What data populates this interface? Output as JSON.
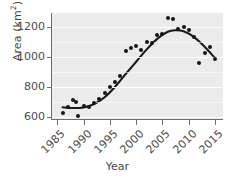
{
  "chart_data": {
    "type": "scatter",
    "title": "",
    "xlabel": "Year",
    "ylabel_text": "Area (km",
    "ylabel_sup": "2",
    "ylabel_tail": ")",
    "ylabel_full": "Area (km2)",
    "xlim": [
      1984,
      2016.5
    ],
    "ylim": [
      585,
      1290
    ],
    "xticks": [
      1985,
      1990,
      1995,
      2000,
      2005,
      2010,
      2015
    ],
    "xtick_labels": [
      "1985",
      "1990",
      "1995",
      "2000",
      "2005",
      "2010",
      "2015"
    ],
    "yticks": [
      600,
      800,
      1000,
      1200
    ],
    "ytick_labels": [
      "600",
      "800",
      "1000",
      "1200"
    ],
    "grid": "horizontal-white-on-gray-panel",
    "legend": "none",
    "panel_color": "#ebebeb",
    "point_color": "#161616",
    "line_color": "#1a1a1a",
    "series": [
      {
        "name": "Observed area",
        "marker": "filled-circle",
        "x": [
          1986,
          1987,
          1988,
          1988.6,
          1989,
          1990,
          1991,
          1992,
          1993,
          1994,
          1995,
          1996,
          1997,
          1998,
          1999,
          2000,
          2001,
          2002,
          2003,
          2004,
          2005,
          2006,
          2007,
          2008,
          2009,
          2010,
          2011,
          2012,
          2013,
          2014,
          2015
        ],
        "y": [
          625,
          665,
          712,
          700,
          604,
          672,
          668,
          690,
          718,
          757,
          800,
          828,
          870,
          1035,
          1058,
          1070,
          1045,
          1095,
          1090,
          1142,
          1150,
          1255,
          1248,
          1185,
          1197,
          1178,
          1128,
          960,
          1022,
          1065,
          985
        ]
      },
      {
        "name": "Smoothed trend",
        "type": "line",
        "x": [
          1986,
          1988,
          1990,
          1992,
          1994,
          1996,
          1998,
          2000,
          2002,
          2004,
          2006,
          2007.5,
          2009,
          2011,
          2013,
          2015
        ],
        "y": [
          663,
          658,
          662,
          684,
          730,
          800,
          884,
          966,
          1048,
          1118,
          1165,
          1175,
          1168,
          1130,
          1066,
          990
        ]
      }
    ]
  }
}
